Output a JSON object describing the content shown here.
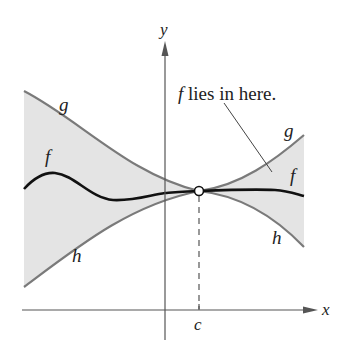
{
  "figure": {
    "axes": {
      "x_label": "x",
      "y_label": "y",
      "c_label": "c"
    },
    "curves": {
      "g_label": "g",
      "g_label_right": "g",
      "f_label": "f",
      "f_label_right": "f",
      "h_label": "h",
      "h_label_right": "h"
    },
    "annotation": {
      "italic_part": "f",
      "text": " lies in here."
    },
    "colors": {
      "shade": "#e4e4e4",
      "bound_curve": "#7a7a7a",
      "f_curve": "#111111",
      "axis": "#555555"
    }
  }
}
